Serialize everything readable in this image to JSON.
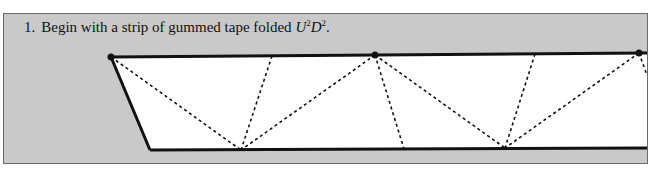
{
  "figure": {
    "step_number": "1.",
    "caption_text": "Begin with a strip of gummed tape folded",
    "fold_notation": {
      "first_letter": "U",
      "first_exponent": "2",
      "second_letter": "D",
      "second_exponent": "2",
      "trailing": "."
    },
    "colors": {
      "panel_background": "#c9c9c9",
      "tape_fill": "#ffffff",
      "tape_edge": "#111111",
      "fold_line": "#111111",
      "vertex_dot": "#111111"
    },
    "diagram": {
      "description": "Strip of tape with a slanted left end, triangulated by dashed fold lines",
      "fold_line_style": "dashed",
      "vertex_dot_count": 3
    }
  }
}
